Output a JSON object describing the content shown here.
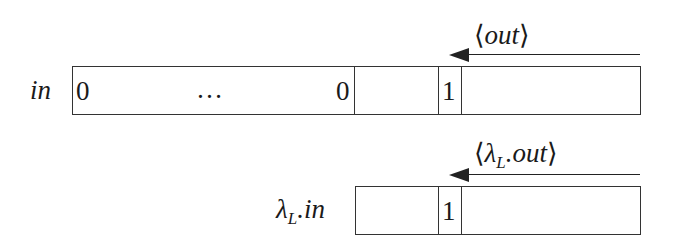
{
  "top_row": {
    "label": "in",
    "cells": [
      "0",
      "…",
      "0",
      "",
      "1",
      ""
    ],
    "arrow_label_prefix": "⟨",
    "arrow_label": "out",
    "arrow_label_suffix": "⟩"
  },
  "bottom_row": {
    "label_main": "λ",
    "label_sub": "L",
    "label_rest": ".in",
    "cells": [
      "",
      "1",
      ""
    ],
    "arrow_label_prefix": "⟨",
    "arrow_label_main": "λ",
    "arrow_label_sub": "L",
    "arrow_label_rest": ".out",
    "arrow_label_suffix": "⟩"
  },
  "colors": {
    "line": "#333333",
    "text": "#1a1a1a",
    "background": "#ffffff"
  }
}
